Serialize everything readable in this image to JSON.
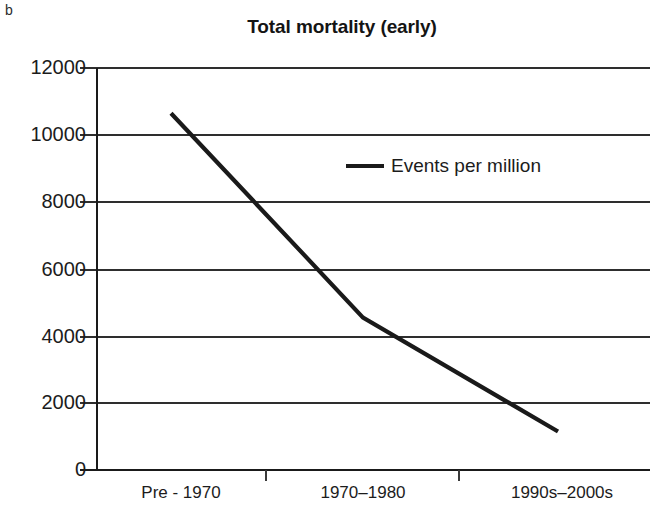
{
  "panel": {
    "label": "b"
  },
  "chart_data": {
    "type": "line",
    "title": "Total mortality (early)",
    "subtitle": "",
    "xlabel": "",
    "ylabel": "",
    "categories": [
      "Pre - 1970",
      "1970–1980",
      "1990s–2000s"
    ],
    "series": [
      {
        "name": "Events per million",
        "values": [
          10650,
          4550,
          1150
        ],
        "color": "#1a1a1a"
      }
    ],
    "ylim": [
      0,
      12000
    ],
    "yticks": [
      0,
      2000,
      4000,
      6000,
      8000,
      10000,
      12000
    ],
    "ytick_labels": [
      "0",
      "2000",
      "4000",
      "6000",
      "8000",
      "10000",
      "12000"
    ],
    "grid": true,
    "grid_axis": "y",
    "legend": {
      "position": "inside-upper-center",
      "entries": [
        "Events per million"
      ]
    }
  },
  "axes": {
    "y_axis_name": "events-per-million-axis",
    "x_axis_name": "time-period-axis"
  }
}
